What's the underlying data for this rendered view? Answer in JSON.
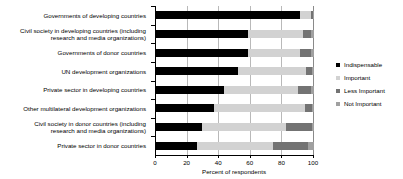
{
  "chart_data": {
    "type": "bar",
    "orientation": "horizontal",
    "stacked": true,
    "normalized": "percent",
    "title": "",
    "xlabel": "Percent of respondents",
    "ylabel": "",
    "xlim": [
      0,
      100
    ],
    "xticks": [
      0,
      20,
      40,
      60,
      80,
      100
    ],
    "grid": true,
    "legend_position": "right",
    "categories": [
      "Governments of developing countries",
      "Civil society in developing countries (including\nresearch and media organizations)",
      "Governments of donor countries",
      "UN development organizations",
      "Private sector in developing countries",
      "Other multilateral development organizations",
      "Civil society in donor countries (including\nresearch and media organizations)",
      "Private sector in donor countries"
    ],
    "series": [
      {
        "name": "Indispensable",
        "color": "#000000",
        "values": [
          91,
          58,
          58,
          52,
          43,
          37,
          29,
          26
        ]
      },
      {
        "name": "Important",
        "color": "#d2d2d2",
        "values": [
          7,
          35,
          33,
          43,
          47,
          57,
          53,
          48
        ]
      },
      {
        "name": "Less Important",
        "color": "#737373",
        "values": [
          1.5,
          5,
          7,
          4,
          8,
          5,
          17,
          22
        ]
      },
      {
        "name": "Not Important",
        "color": "#a0a0a0",
        "values": [
          0.5,
          2,
          2,
          1,
          2,
          1,
          1,
          4
        ]
      }
    ]
  },
  "legend": {
    "items": [
      {
        "label": "Indispensable",
        "color": "#000000"
      },
      {
        "label": "Important",
        "color": "#d2d2d2"
      },
      {
        "label": "Less Important",
        "color": "#737373"
      },
      {
        "label": "Not Important",
        "color": "#a0a0a0"
      }
    ]
  }
}
